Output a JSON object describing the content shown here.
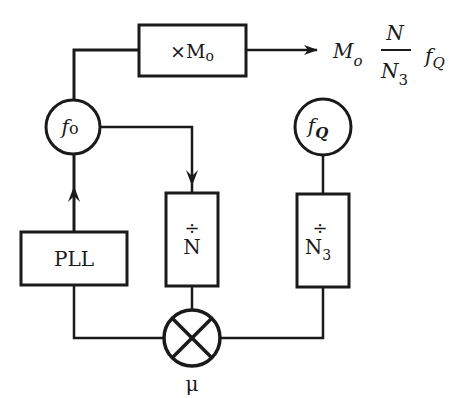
{
  "diagram": {
    "type": "block-diagram",
    "blocks": {
      "multiplier": {
        "label_prefix": "×",
        "label_main": "M",
        "label_sub": "o"
      },
      "pll": {
        "label": "PLL"
      },
      "divider_n": {
        "symbol": "÷",
        "label": "N"
      },
      "divider_n3": {
        "symbol": "÷",
        "label": "N",
        "label_sub": "3"
      },
      "mixer": {
        "symbol": "⊗",
        "label": "μ"
      }
    },
    "nodes": {
      "f0": {
        "label_main": "f",
        "label_sub": "o"
      },
      "fq": {
        "label_main": "f",
        "label_sub": "Q"
      }
    },
    "output": {
      "m": "M",
      "m_sub": "o",
      "frac_num": "N",
      "frac_den": "N",
      "frac_den_sub": "3",
      "f": "f",
      "f_sub": "Q"
    },
    "connections": [
      {
        "from": "pll",
        "to": "f0",
        "arrow": true
      },
      {
        "from": "f0",
        "to": "multiplier",
        "arrow": false
      },
      {
        "from": "multiplier",
        "to": "output",
        "arrow": true
      },
      {
        "from": "f0",
        "to": "divider_n",
        "arrow": true
      },
      {
        "from": "fq",
        "to": "divider_n3",
        "arrow": false
      },
      {
        "from": "divider_n",
        "to": "mixer",
        "arrow": false
      },
      {
        "from": "divider_n3",
        "to": "mixer",
        "arrow": false
      },
      {
        "from": "mixer",
        "to": "pll",
        "arrow": false
      }
    ]
  }
}
